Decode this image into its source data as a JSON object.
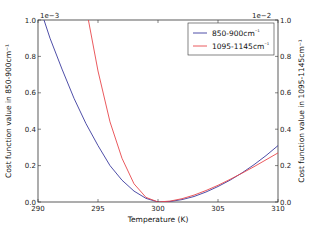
{
  "chart_data": {
    "type": "line",
    "title": "",
    "xlabel": "Temperature (K)",
    "ylabel_left": "Cost function value in 850-900cm⁻¹",
    "ylabel_right": "Cost function value in 1095-1145cm⁻¹",
    "xlim": [
      290,
      310
    ],
    "ylim_left": [
      0.0,
      1.0
    ],
    "ylim_right": [
      0.0,
      1.0
    ],
    "left_scale_label": "1e−3",
    "right_scale_label": "1e−2",
    "x_ticks": [
      "290",
      "295",
      "300",
      "305",
      "310"
    ],
    "y_ticks_left": [
      "0.0",
      "0.2",
      "0.4",
      "0.6",
      "0.8",
      "1.0"
    ],
    "y_ticks_right": [
      "0.0",
      "0.2",
      "0.4",
      "0.6",
      "0.8",
      "1.0"
    ],
    "grid": false,
    "legend_position": "upper right",
    "series": [
      {
        "name": "850-900cm⁻¹",
        "axis": "left",
        "color": "#3b3b9e",
        "x": [
          290.5,
          291,
          292,
          293,
          294,
          295,
          296,
          297,
          298,
          299,
          300,
          301,
          302,
          303,
          304,
          305,
          306,
          307,
          308,
          309,
          310
        ],
        "values": [
          1.0,
          0.9,
          0.73,
          0.57,
          0.43,
          0.31,
          0.2,
          0.12,
          0.06,
          0.02,
          0.0,
          0.003,
          0.013,
          0.03,
          0.055,
          0.085,
          0.12,
          0.16,
          0.205,
          0.255,
          0.31
        ]
      },
      {
        "name": "1095-1145cm⁻¹",
        "axis": "right",
        "color": "#e8474c",
        "x": [
          294.2,
          295,
          296,
          297,
          298,
          299,
          300,
          301,
          302,
          303,
          304,
          305,
          306,
          307,
          308,
          309,
          310
        ],
        "values": [
          1.0,
          0.72,
          0.44,
          0.24,
          0.1,
          0.025,
          0.0,
          0.005,
          0.018,
          0.038,
          0.063,
          0.092,
          0.124,
          0.158,
          0.194,
          0.232,
          0.27
        ]
      }
    ]
  },
  "legend": {
    "items": [
      {
        "label": "850-900cm",
        "sup": "⁻¹",
        "color": "#3b3b9e"
      },
      {
        "label": "1095-1145cm",
        "sup": "⁻¹",
        "color": "#e8474c"
      }
    ]
  }
}
